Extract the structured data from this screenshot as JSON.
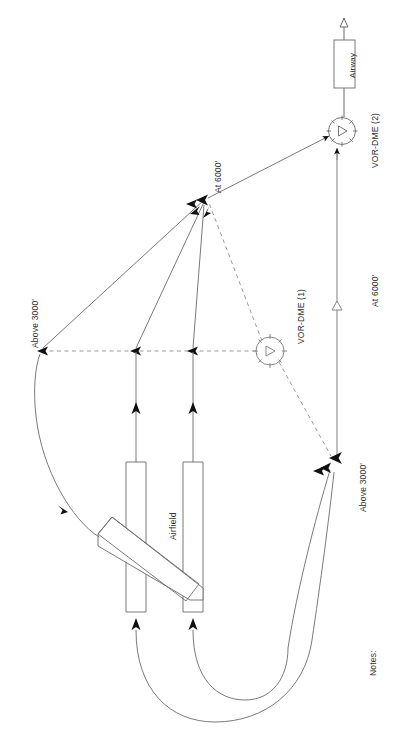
{
  "document": {
    "type": "instrument-departure-chart",
    "orientation": "rotated-90",
    "background_color": "#ffffff",
    "line_color": "#4a4a4a",
    "text_color": "#2b2b2b"
  },
  "labels": {
    "airway": "Airway",
    "vor_dme_2": "VOR-DME (2)",
    "vor_dme_1": "VOR-DME (1)",
    "at_6000_top": "At 6000'",
    "at_6000_right": "At 6000'",
    "above_3000_left": "Above 3000'",
    "above_3000_right": "Above 3000'",
    "airfield": "Airfield",
    "notes": "Notes:"
  },
  "altitudes": {
    "airway_exit": "At 6000'",
    "merge_point": "At 6000'",
    "left_gate": "Above 3000'",
    "right_gate": "Above 3000'"
  },
  "navaids": [
    {
      "name": "VOR-DME (1)",
      "x": 270,
      "y": 351,
      "radius": 16
    },
    {
      "name": "VOR-DME (2)",
      "x": 342,
      "y": 131,
      "radius": 15
    }
  ],
  "features": {
    "airfield_label": "Airfield",
    "airway_box_label": "Airway",
    "notes_label": "Notes:"
  }
}
